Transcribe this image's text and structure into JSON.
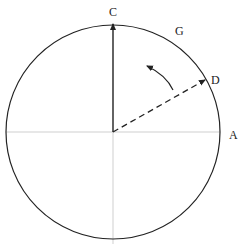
{
  "diagram": {
    "type": "rotation-circle",
    "labels": {
      "top": "C",
      "arc": "G",
      "diagonal": "D",
      "right": "A"
    },
    "colors": {
      "circle": "#222222",
      "axes": "#cfcfcf",
      "vector": "#222222"
    },
    "geometry": {
      "center": [
        113,
        132
      ],
      "radius": 107,
      "vector_solid": {
        "from": "center",
        "to": "C",
        "style": "solid",
        "angle_deg": 90
      },
      "vector_dashed": {
        "from": "center",
        "to": "D",
        "style": "dashed",
        "angle_deg": 30
      },
      "rotation_arrow": {
        "direction": "counterclockwise",
        "from": "D",
        "toward": "C"
      }
    }
  }
}
